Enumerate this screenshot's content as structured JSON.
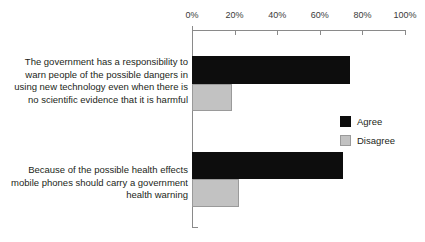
{
  "chart_data": {
    "type": "bar",
    "orientation": "horizontal",
    "title": "",
    "xlabel": "",
    "ylabel": "",
    "xlim": [
      0,
      100
    ],
    "grid": false,
    "legend_position": "right",
    "tick_labels": [
      "0%",
      "20%",
      "40%",
      "60%",
      "80%",
      "100%"
    ],
    "tick_values": [
      0,
      20,
      40,
      60,
      80,
      100
    ],
    "categories": [
      "The government has a responsibility to warn people of the possible dangers in using new technology even when there is no scientific evidence that it is harmful",
      "Because of the possible health effects mobile phones should carry a government health warning"
    ],
    "category_lines": [
      [
        "The government has a responsibility to",
        "warn people of the possible dangers in",
        "using new technology even when there is",
        "no scientific evidence that it is harmful"
      ],
      [
        "Because of the possible health effects",
        "mobile phones should carry a government",
        "health warning"
      ]
    ],
    "series": [
      {
        "name": "Agree",
        "color": "#0d0d0d",
        "values": [
          74,
          71
        ]
      },
      {
        "name": "Disagree",
        "color": "#c2c2c2",
        "values": [
          19,
          22
        ]
      }
    ]
  },
  "legend": {
    "items": [
      {
        "label": "Agree"
      },
      {
        "label": "Disagree"
      }
    ]
  },
  "axis": {
    "line_color": "#8a8a8a"
  }
}
